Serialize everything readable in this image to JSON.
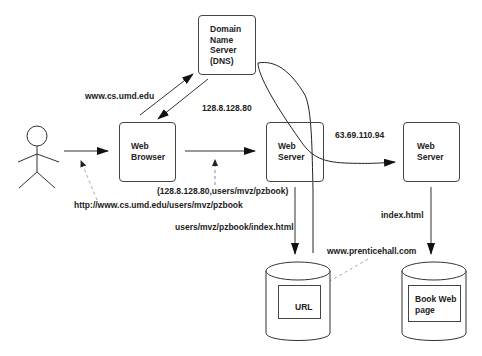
{
  "nodes": {
    "dns": {
      "label": "Domain\nName\nServer\n(DNS)"
    },
    "web_browser": {
      "label": "Web\nBrowser"
    },
    "web_server_umd": {
      "label": "Web\nServer"
    },
    "web_server_ph": {
      "label": "Web\nServer"
    },
    "db_umd": {
      "inner_label": "URL"
    },
    "db_ph": {
      "inner_label": "Book Web\npage"
    }
  },
  "edges": {
    "browser_to_dns": {
      "label": "www.cs.umd.edu"
    },
    "dns_to_browser": {
      "label": "128.8.128.80"
    },
    "user_to_browser": {
      "label": "http://www.cs.umd.edu/users/mvz/pzbook"
    },
    "browser_to_server": {
      "label": "(128.8.128.80,users/mvz/pzbook)"
    },
    "server_to_db": {
      "label": "users/mvz/pzbook/index.html"
    },
    "redirect_to_ph": {
      "label": "63.69.110.94"
    },
    "url_to_ph": {
      "label": "www.prenticehall.com"
    },
    "ph_server_to_db": {
      "label": "index.html"
    }
  },
  "colors": {
    "stroke": "#333333",
    "dashed": "#999999",
    "text": "#222222",
    "background": "#ffffff"
  }
}
